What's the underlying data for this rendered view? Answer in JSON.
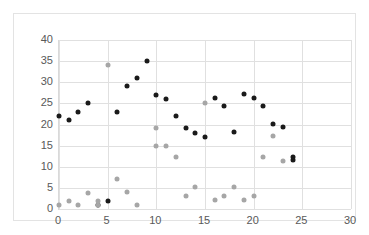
{
  "chart_data": {
    "type": "scatter",
    "title": "",
    "xlabel": "",
    "ylabel": "",
    "xlim": [
      0,
      30
    ],
    "ylim": [
      0,
      40
    ],
    "grid": true,
    "legend": "none",
    "xticks": [
      0,
      5,
      10,
      15,
      20,
      25,
      30
    ],
    "yticks": [
      0,
      5,
      10,
      15,
      20,
      25,
      30,
      35,
      40
    ],
    "xtick_labels": [
      "0",
      "5",
      "10",
      "15",
      "20",
      "25",
      "30"
    ],
    "ytick_labels": [
      "0",
      "5",
      "10",
      "15",
      "20",
      "25",
      "30",
      "35",
      "40"
    ],
    "series": [
      {
        "name": "Series 1",
        "color": "#1a1a1a",
        "marker": "circle",
        "points": [
          [
            0,
            22.0
          ],
          [
            1,
            21.0
          ],
          [
            2,
            23.0
          ],
          [
            3,
            25.0
          ],
          [
            4,
            1.0
          ],
          [
            5,
            1.9
          ],
          [
            6,
            23.0
          ],
          [
            7,
            29.0
          ],
          [
            8,
            31.0
          ],
          [
            9,
            35.0
          ],
          [
            10,
            27.0
          ],
          [
            11,
            26.0
          ],
          [
            12,
            22.1
          ],
          [
            13,
            19.2
          ],
          [
            14,
            18.1
          ],
          [
            15,
            17.1
          ],
          [
            16,
            26.2
          ],
          [
            17,
            24.3
          ],
          [
            18,
            18.2
          ],
          [
            19,
            27.2
          ],
          [
            20,
            26.3
          ],
          [
            21,
            24.4
          ],
          [
            22,
            20.2
          ],
          [
            23,
            19.4
          ],
          [
            24,
            12.4
          ],
          [
            24,
            11.6
          ]
        ]
      },
      {
        "name": "Series 2",
        "color": "#a6a6a6",
        "marker": "circle",
        "points": [
          [
            0,
            0.9
          ],
          [
            1,
            1.8
          ],
          [
            2,
            0.9
          ],
          [
            3,
            3.9
          ],
          [
            4,
            1.9
          ],
          [
            4,
            0.9
          ],
          [
            5,
            34.0
          ],
          [
            6,
            7.0
          ],
          [
            7,
            4.0
          ],
          [
            8,
            1.0
          ],
          [
            10,
            19.1
          ],
          [
            10,
            15.0
          ],
          [
            11,
            15.0
          ],
          [
            12,
            12.2
          ],
          [
            13,
            3.1
          ],
          [
            14,
            5.1
          ],
          [
            15,
            25.2
          ],
          [
            16,
            2.1
          ],
          [
            17,
            3.1
          ],
          [
            18,
            5.2
          ],
          [
            19,
            2.1
          ],
          [
            20,
            3.1
          ],
          [
            21,
            12.4
          ],
          [
            22,
            17.3
          ],
          [
            23,
            11.4
          ]
        ]
      }
    ]
  }
}
